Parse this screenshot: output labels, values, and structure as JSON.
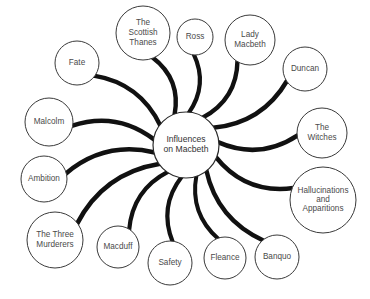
{
  "diagram": {
    "type": "mind-map",
    "background_color": "#ffffff",
    "node_fill": "#ffffff",
    "node_stroke": "#3a3a3a",
    "spoke_color": "#111111",
    "text_color": "#4a4a4a",
    "center": {
      "id": "center",
      "label": "Influences on Macbeth",
      "lines": [
        "Influences",
        "on Macbeth"
      ],
      "cx": 186,
      "cy": 145,
      "r": 33
    },
    "nodes": [
      {
        "id": "the-scottish-thanes",
        "label": "The Scottish Thanes",
        "lines": [
          "The",
          "Scottish",
          "Thanes"
        ],
        "cx": 143,
        "cy": 33,
        "r": 27,
        "spoke_width": 4.4
      },
      {
        "id": "ross",
        "label": "Ross",
        "lines": [
          "Ross"
        ],
        "cx": 195,
        "cy": 37,
        "r": 18,
        "spoke_width": 4.2
      },
      {
        "id": "lady-macbeth",
        "label": "Lady Macbeth",
        "lines": [
          "Lady",
          "Macbeth"
        ],
        "cx": 250,
        "cy": 40,
        "r": 25,
        "spoke_width": 4.4
      },
      {
        "id": "duncan",
        "label": "Duncan",
        "lines": [
          "Duncan"
        ],
        "cx": 305,
        "cy": 69,
        "r": 22,
        "spoke_width": 4.6
      },
      {
        "id": "the-witches",
        "label": "The Witches",
        "lines": [
          "The",
          "Witches"
        ],
        "cx": 322,
        "cy": 133,
        "r": 25,
        "spoke_width": 4.6
      },
      {
        "id": "hallucinations-and-apparitions",
        "label": "Hallucinations and Apparitions",
        "lines": [
          "Hallucinations",
          "and",
          "Apparitions"
        ],
        "cx": 323,
        "cy": 200,
        "r": 33,
        "spoke_width": 4.6
      },
      {
        "id": "banquo",
        "label": "Banquo",
        "lines": [
          "Banquo"
        ],
        "cx": 277,
        "cy": 257,
        "r": 22,
        "spoke_width": 4.4
      },
      {
        "id": "fleance",
        "label": "Fleance",
        "lines": [
          "Fleance"
        ],
        "cx": 225,
        "cy": 258,
        "r": 21,
        "spoke_width": 4.0
      },
      {
        "id": "safety",
        "label": "Safety",
        "lines": [
          "Safety"
        ],
        "cx": 170,
        "cy": 263,
        "r": 22,
        "spoke_width": 4.2
      },
      {
        "id": "macduff",
        "label": "Macduff",
        "lines": [
          "Macduff"
        ],
        "cx": 118,
        "cy": 247,
        "r": 21,
        "spoke_width": 4.2
      },
      {
        "id": "the-three-murderers",
        "label": "The Three Murderers",
        "lines": [
          "The Three",
          "Murderers"
        ],
        "cx": 55,
        "cy": 240,
        "r": 28,
        "spoke_width": 4.6
      },
      {
        "id": "ambition",
        "label": "Ambition",
        "lines": [
          "Ambition"
        ],
        "cx": 44,
        "cy": 179,
        "r": 23,
        "spoke_width": 4.6
      },
      {
        "id": "malcolm",
        "label": "Malcolm",
        "lines": [
          "Malcolm"
        ],
        "cx": 49,
        "cy": 122,
        "r": 24,
        "spoke_width": 4.6
      },
      {
        "id": "fate",
        "label": "Fate",
        "lines": [
          "Fate"
        ],
        "cx": 77,
        "cy": 63,
        "r": 22,
        "spoke_width": 4.4
      }
    ]
  }
}
